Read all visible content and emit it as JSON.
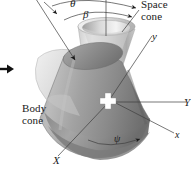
{
  "figure": {
    "background_color": "#ffffff",
    "width": 191,
    "height": 176
  },
  "labels": {
    "space_cone": "Space\ncone",
    "body_cone": "Body\ncone",
    "theta": "θ",
    "beta": "β",
    "psi": "ψ",
    "axis_y_lower": "y",
    "axis_x_lower": "x",
    "axis_Y_upper": "Y",
    "axis_X_upper": "X"
  },
  "colors": {
    "ink": "#1a1a1a",
    "leader_line": "#4a4a4a",
    "space_cone_light": "#d9d9d9",
    "space_cone_mid": "#b8b8b8",
    "body_cone_light": "#cfcfcf",
    "body_cone_dark": "#8f8f8f",
    "body_cone_darkest": "#6e6e6e",
    "marker_white": "#ffffff",
    "arrow_black": "#111111"
  },
  "annotations": {
    "left_arrow": "right-pointing-arrow",
    "center_marker": "white-cross-marker"
  }
}
